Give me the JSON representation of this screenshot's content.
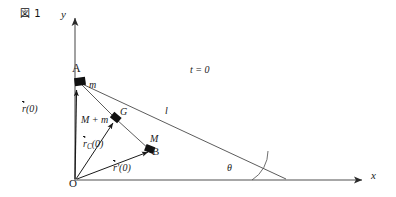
{
  "figure": {
    "tag": "図 1",
    "width": 396,
    "height": 197,
    "background": "#ffffff",
    "stroke_color": "#3a3a3a",
    "axis_color": "#808080",
    "text_color": "#1a1a1a"
  },
  "axes": {
    "y_label": "y",
    "x_label": "x",
    "origin_label": "O"
  },
  "points": {
    "a": {
      "label": "A",
      "mass": "m"
    },
    "g": {
      "label": "G",
      "mass": "M + m"
    },
    "b": {
      "label": "B",
      "mass": "M"
    }
  },
  "annotations": {
    "time": "t = 0",
    "rod_length": "l",
    "angle": "θ"
  },
  "vectors": {
    "r0": {
      "head": "r",
      "sub": "",
      "prime": "",
      "arg": "(0)"
    },
    "rc0": {
      "head": "r",
      "sub": "C",
      "prime": "",
      "arg": "(0)"
    },
    "rp0": {
      "head": "r",
      "sub": "",
      "prime": "′",
      "arg": "(0)"
    }
  },
  "geometry": {
    "origin": [
      75,
      180
    ],
    "point_a": [
      78,
      81
    ],
    "point_g": [
      115,
      118
    ],
    "point_b": [
      150,
      149
    ],
    "foot": [
      286,
      179
    ],
    "y_axis_top": [
      75,
      15
    ],
    "x_axis_right": [
      368,
      180
    ],
    "theta_deg": 25
  }
}
